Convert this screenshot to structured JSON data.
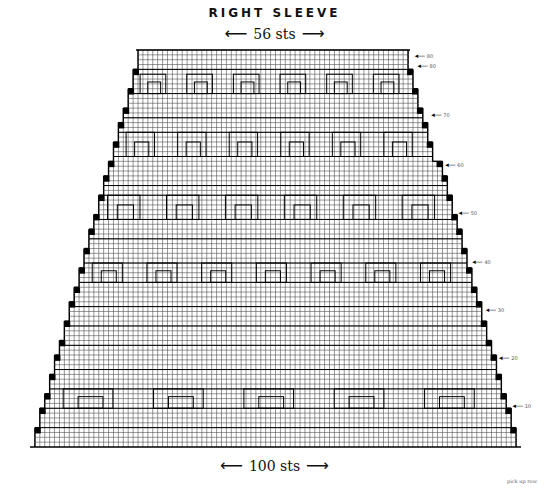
{
  "title": "RIGHT SLEEVE",
  "top_width": {
    "label": "56 sts",
    "stitches": 56
  },
  "bottom_width": {
    "label": "100 sts",
    "stitches": 100
  },
  "row_markers": [
    {
      "label": "80",
      "y": 56
    },
    {
      "label": "80",
      "y": 66
    },
    {
      "label": "70",
      "y": 115
    },
    {
      "label": "60",
      "y": 165
    },
    {
      "label": "50",
      "y": 213
    },
    {
      "label": "40",
      "y": 262
    },
    {
      "label": "30",
      "y": 310
    },
    {
      "label": "20",
      "y": 358
    },
    {
      "label": "10",
      "y": 406
    }
  ],
  "pick_up_label": "pick up row",
  "colors": {
    "grid": "#222222",
    "background": "#ffffff",
    "outline": "#000000"
  },
  "chart_data": {
    "type": "table",
    "title": "RIGHT SLEEVE",
    "rows": 82,
    "top_stitches": 56,
    "bottom_stitches": 100,
    "row_labels": [
      "10",
      "20",
      "30",
      "40",
      "50",
      "60",
      "70",
      "80"
    ],
    "color_codes_sample": [
      "1b",
      "2A",
      "2T",
      "5i",
      "2K",
      "2Z",
      "2W",
      "XW",
      "2X",
      "1D",
      "2M",
      "CM",
      "RP",
      "2J",
      "2B",
      "2E",
      "1B",
      "2L",
      "2F",
      "2C",
      "CJ",
      "2b",
      "N"
    ]
  }
}
